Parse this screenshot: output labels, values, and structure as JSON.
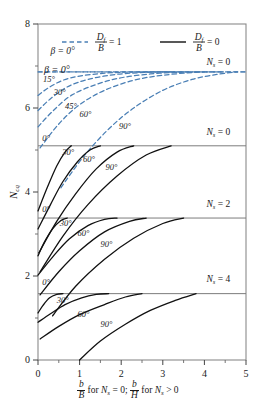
{
  "figure": {
    "title": "",
    "y_axis_label": "N",
    "y_axis_label_sub": "cq",
    "x_axis_label_parts": {
      "num1": "b",
      "den1": "B",
      "mid1": "for",
      "var1": "N",
      "var1sub": "s",
      "eq1": "= 0;",
      "num2": "b",
      "den2": "H",
      "mid2": "for",
      "var2": "N",
      "var2sub": "s",
      "eq2": "> 0"
    }
  },
  "legend": {
    "dashed": {
      "num": "D",
      "numsub": "f",
      "den": "B",
      "value": "= 1",
      "color": "#4a7fb5",
      "style": "dashed"
    },
    "solid": {
      "num": "D",
      "numsub": "f",
      "den": "B",
      "value": "= 0",
      "color": "#111111",
      "style": "solid"
    }
  },
  "axis": {
    "x_ticks": [
      "0",
      "1",
      "2",
      "3",
      "4",
      "5"
    ],
    "y_ticks": [
      "0",
      "2",
      "4",
      "6",
      "8"
    ],
    "xlim": [
      0,
      5
    ],
    "ylim": [
      0,
      8
    ],
    "x_minor": [
      0.5,
      1.5,
      2.5,
      3.5,
      4.5
    ],
    "y_minor": [
      1,
      3,
      5,
      7
    ]
  },
  "band_labels": [
    {
      "text": "N",
      "sub": "s",
      "eq": "= 0",
      "x": 4.05,
      "y": 7.02,
      "name": "band-label-ns0-top"
    },
    {
      "text": "N",
      "sub": "s",
      "eq": "= 0",
      "x": 4.05,
      "y": 5.35,
      "name": "band-label-ns0"
    },
    {
      "text": "N",
      "sub": "s",
      "eq": "= 2",
      "x": 4.05,
      "y": 3.65,
      "name": "band-label-ns2"
    },
    {
      "text": "N",
      "sub": "s",
      "eq": "= 4",
      "x": 4.05,
      "y": 1.85,
      "name": "band-label-ns4"
    }
  ],
  "band_lines": [
    {
      "y": 6.86,
      "style": "dashed",
      "color": "#6d93b8",
      "name": "asymptote-ns0-dashed"
    },
    {
      "y": 5.1,
      "style": "solid",
      "color": "#7c7c7c",
      "name": "divider-ns0"
    },
    {
      "y": 3.38,
      "style": "solid",
      "color": "#7c7c7c",
      "name": "divider-ns2"
    },
    {
      "y": 1.58,
      "style": "solid",
      "color": "#7c7c7c",
      "name": "divider-ns4"
    }
  ],
  "beta_legend_label": {
    "sym": "β",
    "eq": "= 0°"
  },
  "chart_data": {
    "type": "line",
    "title": "",
    "xlabel": "b/B for Ns = 0; b/H for Ns > 0",
    "ylabel": "Ncq",
    "xlim": [
      0,
      5
    ],
    "ylim": [
      0,
      8
    ],
    "grid": false,
    "legend": [
      "Df/B = 1 (dashed blue)",
      "Df/B = 0 (solid black)"
    ],
    "series": [
      {
        "name": "Df/B=1, Ns=0, beta=0",
        "style": "dashed",
        "color": "#4a7fb5",
        "x": [
          0,
          0.4,
          1.0,
          1.6,
          2.2,
          3.0,
          4.0,
          5.0
        ],
        "y": [
          6.86,
          6.86,
          6.86,
          6.86,
          6.86,
          6.86,
          6.86,
          6.86
        ]
      },
      {
        "name": "Df/B=1, Ns=0, beta=15",
        "style": "dashed",
        "color": "#4a7fb5",
        "x": [
          0,
          0.25,
          0.6,
          1.0,
          1.5,
          2.0,
          2.6,
          3.2
        ],
        "y": [
          6.3,
          6.48,
          6.66,
          6.76,
          6.82,
          6.85,
          6.86,
          6.86
        ]
      },
      {
        "name": "Df/B=1, Ns=0, beta=30",
        "style": "dashed",
        "color": "#4a7fb5",
        "x": [
          0,
          0.3,
          0.7,
          1.2,
          1.8,
          2.4,
          3.0,
          3.6
        ],
        "y": [
          5.94,
          6.22,
          6.5,
          6.68,
          6.79,
          6.84,
          6.86,
          6.86
        ]
      },
      {
        "name": "Df/B=1, Ns=0, beta=45",
        "style": "dashed",
        "color": "#4a7fb5",
        "x": [
          0,
          0.35,
          0.8,
          1.4,
          2.0,
          2.7,
          3.4,
          4.0
        ],
        "y": [
          5.55,
          5.92,
          6.3,
          6.56,
          6.72,
          6.81,
          6.85,
          6.86
        ]
      },
      {
        "name": "Df/B=1, Ns=0, beta=60",
        "style": "dashed",
        "color": "#4a7fb5",
        "x": [
          0.05,
          0.5,
          1.0,
          1.6,
          2.3,
          3.0,
          3.8,
          4.4
        ],
        "y": [
          5.05,
          5.62,
          6.08,
          6.42,
          6.66,
          6.78,
          6.85,
          6.86
        ]
      },
      {
        "name": "Df/B=1, Ns=0, beta=90",
        "style": "dashed",
        "color": "#4a7fb5",
        "x": [
          0.55,
          1.1,
          1.7,
          2.3,
          3.0,
          3.7,
          4.3,
          4.8
        ],
        "y": [
          4.1,
          4.85,
          5.5,
          6.0,
          6.42,
          6.68,
          6.8,
          6.86
        ]
      },
      {
        "name": "Df/B=0, Ns=0, beta=0",
        "style": "solid",
        "color": "#111111",
        "x": [
          0,
          0.22,
          0.45,
          0.65,
          0.8
        ],
        "y": [
          3.55,
          4.1,
          4.62,
          4.95,
          5.1
        ]
      },
      {
        "name": "Df/B=0, Ns=0, beta=30",
        "style": "solid",
        "color": "#111111",
        "x": [
          0,
          0.3,
          0.6,
          0.95,
          1.25,
          1.5
        ],
        "y": [
          3.12,
          3.7,
          4.25,
          4.72,
          5.0,
          5.1
        ]
      },
      {
        "name": "Df/B=0, Ns=0, beta=60",
        "style": "solid",
        "color": "#111111",
        "x": [
          0.02,
          0.45,
          0.9,
          1.4,
          1.9,
          2.3
        ],
        "y": [
          2.55,
          3.3,
          3.95,
          4.55,
          4.95,
          5.1
        ]
      },
      {
        "name": "Df/B=0, Ns=0, beta=90",
        "style": "solid",
        "color": "#111111",
        "x": [
          0.05,
          0.6,
          1.2,
          1.9,
          2.6,
          3.2
        ],
        "y": [
          2.1,
          2.95,
          3.7,
          4.38,
          4.88,
          5.1
        ]
      },
      {
        "name": "Df/B=0, Ns=2, beta=0",
        "style": "solid",
        "color": "#111111",
        "x": [
          0,
          0.15,
          0.35,
          0.55,
          0.7
        ],
        "y": [
          2.48,
          2.8,
          3.12,
          3.32,
          3.38
        ]
      },
      {
        "name": "Df/B=0, Ns=2, beta=30",
        "style": "solid",
        "color": "#111111",
        "x": [
          0,
          0.35,
          0.75,
          1.2,
          1.6,
          1.9
        ],
        "y": [
          2.02,
          2.45,
          2.88,
          3.2,
          3.35,
          3.38
        ]
      },
      {
        "name": "Df/B=0, Ns=2, beta=60",
        "style": "solid",
        "color": "#111111",
        "x": [
          0.05,
          0.5,
          1.0,
          1.6,
          2.2,
          2.6
        ],
        "y": [
          1.55,
          2.1,
          2.6,
          3.05,
          3.3,
          3.38
        ]
      },
      {
        "name": "Df/B=0, Ns=2, beta=90",
        "style": "solid",
        "color": "#111111",
        "x": [
          0.35,
          0.9,
          1.6,
          2.3,
          3.0,
          3.5
        ],
        "y": [
          1.05,
          1.75,
          2.4,
          2.9,
          3.25,
          3.38
        ]
      },
      {
        "name": "Df/B=0, Ns=4, beta=0",
        "style": "solid",
        "color": "#111111",
        "x": [
          0,
          0.12,
          0.28,
          0.45,
          0.6
        ],
        "y": [
          1.12,
          1.3,
          1.48,
          1.56,
          1.58
        ]
      },
      {
        "name": "Df/B=0, Ns=4, beta=30",
        "style": "solid",
        "color": "#111111",
        "x": [
          0,
          0.3,
          0.65,
          1.05,
          1.4,
          1.7
        ],
        "y": [
          0.9,
          1.1,
          1.32,
          1.48,
          1.56,
          1.58
        ]
      },
      {
        "name": "Df/B=0, Ns=4, beta=60",
        "style": "solid",
        "color": "#111111",
        "x": [
          0.05,
          0.5,
          1.0,
          1.6,
          2.1,
          2.5
        ],
        "y": [
          0.5,
          0.8,
          1.08,
          1.32,
          1.5,
          1.58
        ]
      },
      {
        "name": "Df/B=0, Ns=4, beta=90",
        "style": "solid",
        "color": "#111111",
        "x": [
          1.0,
          1.5,
          2.1,
          2.7,
          3.3,
          3.8
        ],
        "y": [
          0.0,
          0.45,
          0.85,
          1.18,
          1.42,
          1.58
        ]
      }
    ],
    "annotations": [
      {
        "text": "β = 0°",
        "x": 0.3,
        "y": 7.28,
        "name": "beta-0-top"
      },
      {
        "text": "15°",
        "x": 0.12,
        "y": 6.62,
        "name": "beta-15"
      },
      {
        "text": "30°",
        "x": 0.38,
        "y": 6.3,
        "name": "beta-30"
      },
      {
        "text": "45°",
        "x": 0.65,
        "y": 5.98,
        "name": "beta-45"
      },
      {
        "text": "60°",
        "x": 1.0,
        "y": 5.78,
        "name": "beta-60"
      },
      {
        "text": "90°",
        "x": 1.95,
        "y": 5.5,
        "name": "beta-90"
      },
      {
        "text": "0°",
        "x": 0.1,
        "y": 5.22,
        "name": "solid-ns0-0"
      },
      {
        "text": "30°",
        "x": 0.58,
        "y": 4.88,
        "name": "solid-ns0-30"
      },
      {
        "text": "60°",
        "x": 1.08,
        "y": 4.72,
        "name": "solid-ns0-60"
      },
      {
        "text": "90°",
        "x": 1.62,
        "y": 4.52,
        "name": "solid-ns0-90"
      },
      {
        "text": "0°",
        "x": 0.1,
        "y": 3.52,
        "name": "solid-ns2-0"
      },
      {
        "text": "30°",
        "x": 0.52,
        "y": 3.18,
        "name": "solid-ns2-30"
      },
      {
        "text": "60°",
        "x": 0.95,
        "y": 2.95,
        "name": "solid-ns2-60"
      },
      {
        "text": "90°",
        "x": 1.5,
        "y": 2.68,
        "name": "solid-ns2-90"
      },
      {
        "text": "0°",
        "x": 0.1,
        "y": 1.78,
        "name": "solid-ns4-0"
      },
      {
        "text": "30°",
        "x": 0.45,
        "y": 1.35,
        "name": "solid-ns4-30"
      },
      {
        "text": "60°",
        "x": 0.95,
        "y": 1.02,
        "name": "solid-ns4-60"
      },
      {
        "text": "90°",
        "x": 1.5,
        "y": 0.78,
        "name": "solid-ns4-90"
      }
    ]
  }
}
